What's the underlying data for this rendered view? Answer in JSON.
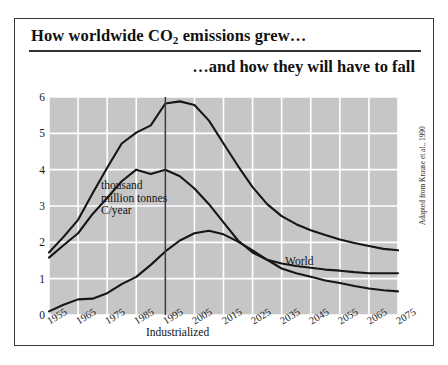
{
  "figure": {
    "title_line_1_before": "How worldwide CO",
    "title_line_1_sub": "2",
    "title_line_1_after": " emissions grew…",
    "title_line_2": "…and how they will have to fall",
    "source_credit": "Adapted from Krause et al., 1990",
    "unit_caption_lines": [
      "thousand",
      "million tonnes",
      "C/year"
    ],
    "divider_year": "1995"
  },
  "chart_data": {
    "type": "line",
    "title": "How worldwide CO2 emissions grew… …and how they will have to fall",
    "xlabel": "",
    "ylabel": "thousand million tonnes C/year",
    "xlim": [
      1955,
      2075
    ],
    "ylim": [
      0,
      6
    ],
    "grid": true,
    "grid_color": "#ffffff",
    "plot_background": "#c6c6c6",
    "legend": "inline-labels",
    "x_ticks": [
      1955,
      1965,
      1975,
      1985,
      1995,
      2005,
      2015,
      2025,
      2035,
      2045,
      2055,
      2065,
      2075
    ],
    "y_ticks": [
      0,
      1,
      2,
      3,
      4,
      5,
      6
    ],
    "annotations": [
      {
        "text": "World",
        "x": 2022,
        "y": 3.1
      },
      {
        "text": "Industrialized",
        "x": 1977,
        "y": 2.25
      },
      {
        "text": "Developing",
        "x": 1978,
        "y": 0.42
      },
      {
        "text": "thousand million tonnes C/year",
        "x": 1962,
        "y": 5.75
      }
    ],
    "vertical_marker": {
      "x": 1995,
      "color": "#3a3a4e"
    },
    "x": [
      1955,
      1960,
      1965,
      1970,
      1975,
      1980,
      1985,
      1990,
      1995,
      2000,
      2005,
      2010,
      2015,
      2020,
      2025,
      2030,
      2035,
      2040,
      2045,
      2050,
      2055,
      2060,
      2065,
      2070,
      2075
    ],
    "series": [
      {
        "name": "World",
        "color": "#161616",
        "values": [
          1.72,
          2.15,
          2.62,
          3.35,
          4.05,
          4.72,
          5.02,
          5.22,
          5.82,
          5.88,
          5.78,
          5.35,
          4.72,
          4.1,
          3.52,
          3.05,
          2.72,
          2.5,
          2.33,
          2.2,
          2.08,
          1.98,
          1.9,
          1.82,
          1.78
        ]
      },
      {
        "name": "Industrialized",
        "color": "#161616",
        "values": [
          1.58,
          1.92,
          2.25,
          2.78,
          3.22,
          3.68,
          4.0,
          3.88,
          4.0,
          3.82,
          3.48,
          3.05,
          2.55,
          2.05,
          1.72,
          1.52,
          1.42,
          1.35,
          1.3,
          1.25,
          1.22,
          1.18,
          1.15,
          1.15,
          1.15
        ]
      },
      {
        "name": "Developing",
        "color": "#161616",
        "values": [
          0.1,
          0.28,
          0.43,
          0.45,
          0.6,
          0.85,
          1.05,
          1.38,
          1.75,
          2.05,
          2.25,
          2.32,
          2.22,
          2.02,
          1.78,
          1.52,
          1.28,
          1.15,
          1.05,
          0.95,
          0.88,
          0.8,
          0.73,
          0.68,
          0.65
        ]
      }
    ]
  }
}
